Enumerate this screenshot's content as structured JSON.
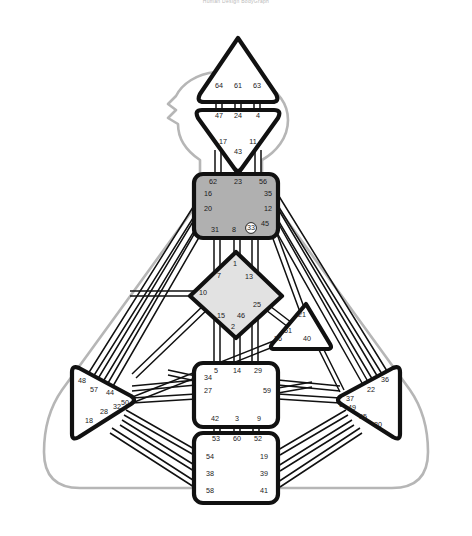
{
  "caption": "Human Design BodyGraph",
  "colors": {
    "background": "#ffffff",
    "center_stroke": "#111111",
    "channel_stroke": "#111111",
    "body_outline": "#b6b6b6",
    "defined_throat": "#b0b0b0",
    "defined_g": "#e2e2e2",
    "undefined_fill": "#ffffff",
    "gate_text": "#1a1a1a",
    "activated_gate_fill": "#ffffff"
  },
  "centers": [
    {
      "id": "head",
      "name": "Head",
      "shape": "triangle-up",
      "state": "undefined",
      "gates": [
        {
          "num": "64",
          "x": 219,
          "y": 86
        },
        {
          "num": "61",
          "x": 238,
          "y": 86
        },
        {
          "num": "63",
          "x": 257,
          "y": 86
        }
      ]
    },
    {
      "id": "ajna",
      "name": "Ajna",
      "shape": "triangle-down",
      "state": "undefined",
      "gates": [
        {
          "num": "47",
          "x": 219,
          "y": 116
        },
        {
          "num": "24",
          "x": 238,
          "y": 116
        },
        {
          "num": "4",
          "x": 258,
          "y": 116
        },
        {
          "num": "17",
          "x": 223,
          "y": 142
        },
        {
          "num": "11",
          "x": 253,
          "y": 142
        },
        {
          "num": "43",
          "x": 238,
          "y": 152
        }
      ]
    },
    {
      "id": "throat",
      "name": "Throat",
      "shape": "square",
      "state": "defined",
      "gates": [
        {
          "num": "62",
          "x": 213,
          "y": 182
        },
        {
          "num": "23",
          "x": 238,
          "y": 182
        },
        {
          "num": "56",
          "x": 263,
          "y": 182
        },
        {
          "num": "16",
          "x": 208,
          "y": 194
        },
        {
          "num": "35",
          "x": 268,
          "y": 194
        },
        {
          "num": "20",
          "x": 208,
          "y": 209
        },
        {
          "num": "12",
          "x": 268,
          "y": 209
        },
        {
          "num": "31",
          "x": 215,
          "y": 230
        },
        {
          "num": "8",
          "x": 234,
          "y": 230
        },
        {
          "num": "33",
          "x": 251,
          "y": 228,
          "activated": true
        },
        {
          "num": "45",
          "x": 265,
          "y": 224
        }
      ]
    },
    {
      "id": "g",
      "name": "G Center / Identity",
      "shape": "diamond",
      "state": "defined",
      "gates": [
        {
          "num": "1",
          "x": 235,
          "y": 264
        },
        {
          "num": "7",
          "x": 219,
          "y": 276
        },
        {
          "num": "13",
          "x": 249,
          "y": 277
        },
        {
          "num": "10",
          "x": 203,
          "y": 293
        },
        {
          "num": "25",
          "x": 257,
          "y": 305
        },
        {
          "num": "15",
          "x": 221,
          "y": 316
        },
        {
          "num": "46",
          "x": 241,
          "y": 316
        },
        {
          "num": "2",
          "x": 233,
          "y": 327
        }
      ]
    },
    {
      "id": "heart",
      "name": "Heart / Ego",
      "shape": "triangle-right",
      "state": "undefined",
      "gates": [
        {
          "num": "21",
          "x": 302,
          "y": 315
        },
        {
          "num": "51",
          "x": 288,
          "y": 331
        },
        {
          "num": "26",
          "x": 278,
          "y": 339
        },
        {
          "num": "40",
          "x": 307,
          "y": 339
        }
      ]
    },
    {
      "id": "spleen",
      "name": "Spleen",
      "shape": "triangle-right",
      "state": "undefined",
      "gates": [
        {
          "num": "48",
          "x": 82,
          "y": 381
        },
        {
          "num": "57",
          "x": 94,
          "y": 390
        },
        {
          "num": "44",
          "x": 110,
          "y": 393
        },
        {
          "num": "32",
          "x": 117,
          "y": 407
        },
        {
          "num": "50",
          "x": 125,
          "y": 403
        },
        {
          "num": "28",
          "x": 104,
          "y": 412
        },
        {
          "num": "18",
          "x": 89,
          "y": 421
        }
      ]
    },
    {
      "id": "sacral",
      "name": "Sacral",
      "shape": "square",
      "state": "undefined",
      "gates": [
        {
          "num": "5",
          "x": 216,
          "y": 371
        },
        {
          "num": "14",
          "x": 237,
          "y": 371
        },
        {
          "num": "29",
          "x": 258,
          "y": 371
        },
        {
          "num": "34",
          "x": 208,
          "y": 378
        },
        {
          "num": "27",
          "x": 208,
          "y": 391
        },
        {
          "num": "59",
          "x": 267,
          "y": 391
        },
        {
          "num": "42",
          "x": 215,
          "y": 419
        },
        {
          "num": "3",
          "x": 237,
          "y": 419
        },
        {
          "num": "9",
          "x": 259,
          "y": 419
        }
      ]
    },
    {
      "id": "solar",
      "name": "Solar Plexus",
      "shape": "triangle-left",
      "state": "undefined",
      "gates": [
        {
          "num": "36",
          "x": 385,
          "y": 380
        },
        {
          "num": "22",
          "x": 371,
          "y": 390
        },
        {
          "num": "37",
          "x": 350,
          "y": 399
        },
        {
          "num": "6",
          "x": 341,
          "y": 405
        },
        {
          "num": "49",
          "x": 352,
          "y": 408
        },
        {
          "num": "55",
          "x": 363,
          "y": 417
        },
        {
          "num": "30",
          "x": 378,
          "y": 425
        }
      ]
    },
    {
      "id": "root",
      "name": "Root",
      "shape": "square",
      "state": "undefined",
      "gates": [
        {
          "num": "53",
          "x": 216,
          "y": 439
        },
        {
          "num": "60",
          "x": 237,
          "y": 439
        },
        {
          "num": "52",
          "x": 258,
          "y": 439
        },
        {
          "num": "54",
          "x": 210,
          "y": 457
        },
        {
          "num": "19",
          "x": 264,
          "y": 457
        },
        {
          "num": "38",
          "x": 210,
          "y": 474
        },
        {
          "num": "39",
          "x": 264,
          "y": 474
        },
        {
          "num": "58",
          "x": 210,
          "y": 491
        },
        {
          "num": "41",
          "x": 264,
          "y": 491
        }
      ]
    }
  ],
  "legend": {
    "defined_label": "Defined",
    "undefined_label": "Undefined"
  }
}
